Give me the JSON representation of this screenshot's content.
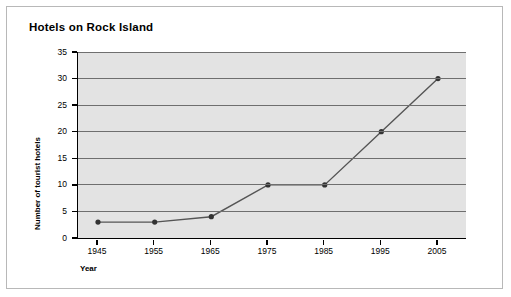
{
  "chart_data": {
    "type": "line",
    "title": "Hotels on Rock Island",
    "xlabel": "Year",
    "ylabel": "Number of tourist hotels",
    "categories": [
      "1945",
      "1955",
      "1965",
      "1975",
      "1985",
      "1995",
      "2005"
    ],
    "x": [
      1945,
      1955,
      1965,
      1975,
      1985,
      1995,
      2005
    ],
    "values": [
      3,
      3,
      4,
      10,
      10,
      20,
      30
    ],
    "series": [
      {
        "name": "Number of tourist hotels",
        "values": [
          3,
          3,
          4,
          10,
          10,
          20,
          30
        ]
      }
    ],
    "ylim": [
      0,
      35
    ],
    "yticks": [
      0,
      5,
      10,
      15,
      20,
      25,
      30,
      35
    ],
    "ytick_labels": [
      "0",
      "5",
      "10",
      "15",
      "20",
      "25",
      "30",
      "35"
    ],
    "xtick_labels": [
      "1945",
      "1955",
      "1965",
      "1975",
      "1985",
      "1995",
      "2005"
    ],
    "grid": "horizontal",
    "legend": "none",
    "line_color": "#555555",
    "marker_color": "#333333",
    "plot_background": "#e3e3e3",
    "figure_background": "#ffffff"
  }
}
